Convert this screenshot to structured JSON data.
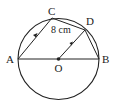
{
  "diagram": {
    "type": "circle-geometry",
    "points": {
      "A": {
        "label": "A",
        "x": 18,
        "y": 59
      },
      "B": {
        "label": "B",
        "x": 99,
        "y": 59
      },
      "C": {
        "label": "C",
        "x": 52,
        "y": 18
      },
      "D": {
        "label": "D",
        "x": 85,
        "y": 30
      },
      "O": {
        "label": "O",
        "x": 58.5,
        "y": 59
      }
    },
    "circle": {
      "center": "O",
      "radius": 40.5
    },
    "segments": [
      "AB",
      "AC",
      "CD",
      "DB",
      "OD"
    ],
    "parallel_marks": [
      "AC",
      "OD"
    ],
    "measurement": {
      "segment": "CD",
      "label": "8 cm"
    },
    "colors": {
      "stroke": "#222222",
      "background": "#ffffff"
    }
  }
}
